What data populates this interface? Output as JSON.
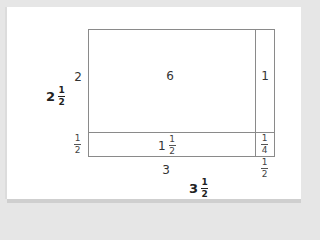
{
  "diagram": {
    "cells": {
      "top_left": "6",
      "top_right": "1",
      "bottom_left": {
        "whole": "1",
        "num": "1",
        "den": "2"
      },
      "bottom_right": {
        "num": "1",
        "den": "4"
      }
    },
    "side_labels": {
      "left_top": "2",
      "left_bottom": {
        "num": "1",
        "den": "2"
      },
      "bottom_left": "3",
      "bottom_right": {
        "num": "1",
        "den": "2"
      }
    },
    "totals": {
      "height": {
        "whole": "2",
        "num": "1",
        "den": "2"
      },
      "width": {
        "whole": "3",
        "num": "1",
        "den": "2"
      }
    },
    "colors": {
      "line": "#8a8a8a",
      "background": "#e6e6e6",
      "card": "#ffffff"
    }
  }
}
